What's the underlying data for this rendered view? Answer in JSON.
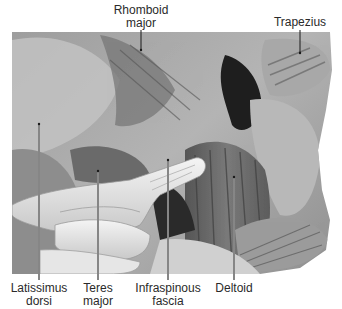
{
  "figure": {
    "colors": {
      "background": "#ffffff",
      "label_text": "#2a2a2a",
      "leader_line": "#1a1a1a",
      "leader_line_light": "#f2f2f2"
    },
    "labels": [
      {
        "id": "rhomboid-major",
        "line1": "Rhomboid",
        "line2": "major",
        "x": 141,
        "y": 4
      },
      {
        "id": "trapezius",
        "line1": "Trapezius",
        "line2": "",
        "x": 300,
        "y": 16
      },
      {
        "id": "latissimus-dorsi",
        "line1": "Latissimus",
        "line2": "dorsi",
        "x": 39,
        "y": 282
      },
      {
        "id": "teres-major",
        "line1": "Teres",
        "line2": "major",
        "x": 98,
        "y": 282
      },
      {
        "id": "infraspinous-fascia",
        "line1": "Infraspinous",
        "line2": "fascia",
        "x": 168,
        "y": 282
      },
      {
        "id": "deltoid",
        "line1": "Deltoid",
        "line2": "",
        "x": 234,
        "y": 282
      }
    ]
  }
}
